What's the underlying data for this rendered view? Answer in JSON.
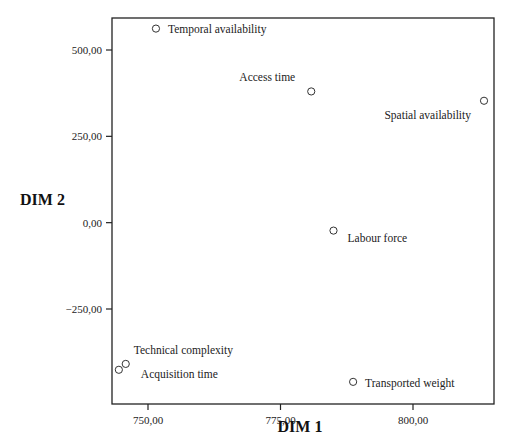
{
  "chart_data": {
    "type": "scatter",
    "title": "",
    "xlabel": "DIM 1",
    "ylabel": "DIM 2",
    "xlim": [
      741.5,
      815.6
    ],
    "ylim": [
      -531,
      594
    ],
    "grid": false,
    "legend": "none",
    "x_ticks": [
      {
        "value": 750,
        "label": "750,00"
      },
      {
        "value": 775,
        "label": "775,00"
      },
      {
        "value": 800,
        "label": "800,00"
      }
    ],
    "y_ticks": [
      {
        "value": 500,
        "label": "500,00"
      },
      {
        "value": 250,
        "label": "250,00"
      },
      {
        "value": 0,
        "label": "0,00"
      },
      {
        "value": -250,
        "label": "-250,00"
      }
    ],
    "points": [
      {
        "label": "Temporal availability",
        "x": 751.5,
        "y": 562,
        "label_dx": 12,
        "label_dy": 4,
        "anchor": "start"
      },
      {
        "label": "Access time",
        "x": 780.8,
        "y": 380,
        "label_dx": -16,
        "label_dy": -10,
        "anchor": "end"
      },
      {
        "label": "Spatial availability",
        "x": 813.4,
        "y": 353,
        "label_dx": -13,
        "label_dy": 18,
        "anchor": "end"
      },
      {
        "label": "Labour force",
        "x": 785.0,
        "y": -23,
        "label_dx": 14,
        "label_dy": 11,
        "anchor": "start"
      },
      {
        "label": "Transported weight",
        "x": 788.7,
        "y": -461,
        "label_dx": 12,
        "label_dy": 5,
        "anchor": "start"
      },
      {
        "label": "Technical complexity",
        "x": 745.8,
        "y": -409,
        "label_dx": 8,
        "label_dy": -10,
        "anchor": "start"
      },
      {
        "label": "Acquisition time",
        "x": 744.5,
        "y": -426,
        "label_dx": 22,
        "label_dy": 8,
        "anchor": "start"
      }
    ]
  },
  "layout": {
    "plot": {
      "left": 112,
      "top": 18,
      "right": 494,
      "bottom": 404
    },
    "x_ref": {
      "v0": 750,
      "px0": 148,
      "v1": 800,
      "px1": 413
    },
    "y_ref": {
      "v0": 500,
      "px0": 50,
      "v1": -250,
      "px1": 309
    },
    "point_radius": 3.6,
    "colors": {
      "axis": "#222222",
      "marker": "#333333",
      "text": "#222222",
      "background": "#ffffff"
    }
  }
}
